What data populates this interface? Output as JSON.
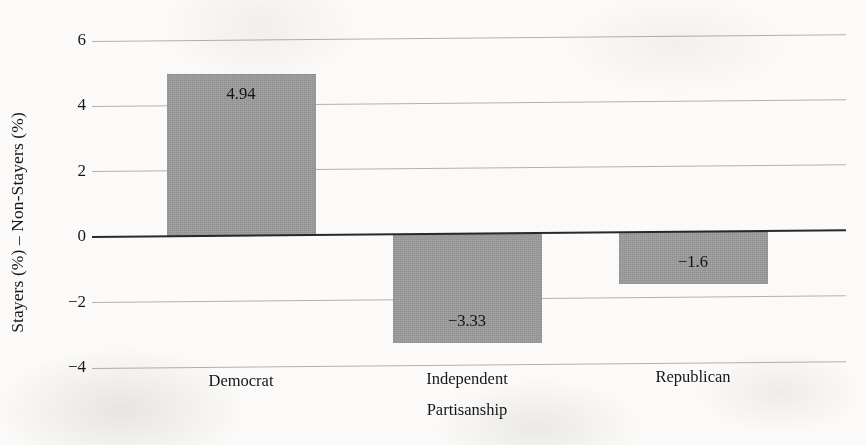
{
  "chart_data": {
    "type": "bar",
    "title": "",
    "subtitle": "",
    "xlabel": "Partisanship",
    "ylabel": "Stayers (%) – Non-Stayers (%)",
    "categories": [
      "Democrat",
      "Independent",
      "Republican"
    ],
    "values": [
      4.94,
      -3.33,
      -1.6
    ],
    "value_labels": [
      "4.94",
      "−3.33",
      "−1.6"
    ],
    "ylim": [
      -4,
      6
    ],
    "yticks": [
      6,
      4,
      2,
      0,
      -2,
      -4
    ],
    "ytick_labels": [
      "6",
      "4",
      "2",
      "0",
      "−2",
      "−4"
    ],
    "grid": true,
    "grid_axis": "y",
    "legend": false,
    "legend_position": "none",
    "zero_line": true,
    "bar_color": "#9b9b9b",
    "grid_color": "#b3b1ae",
    "zero_line_color": "#27282a",
    "text_color": "#15161a",
    "background_color": "#fbfaf8"
  },
  "layout": {
    "plot_left": 92,
    "plot_right": 846,
    "y_top_px": 41,
    "y_bottom_px": 368,
    "bar_width_px": 149,
    "bar_centers_px": [
      241,
      467,
      693
    ]
  }
}
